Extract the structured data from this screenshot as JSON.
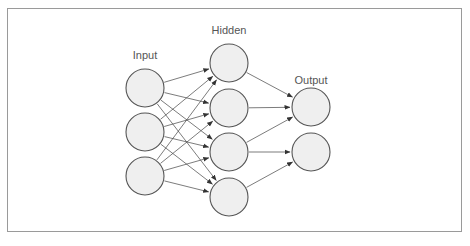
{
  "diagram": {
    "layers": [
      {
        "id": "input",
        "label": "Input",
        "label_pos": {
          "x": 145,
          "y": 59
        },
        "nodes": [
          {
            "id": "i1",
            "cx": 145,
            "cy": 88
          },
          {
            "id": "i2",
            "cx": 145,
            "cy": 132
          },
          {
            "id": "i3",
            "cx": 145,
            "cy": 176
          }
        ]
      },
      {
        "id": "hidden",
        "label": "Hidden",
        "label_pos": {
          "x": 229,
          "y": 34
        },
        "nodes": [
          {
            "id": "h1",
            "cx": 229,
            "cy": 63
          },
          {
            "id": "h2",
            "cx": 229,
            "cy": 108
          },
          {
            "id": "h3",
            "cx": 229,
            "cy": 152
          },
          {
            "id": "h4",
            "cx": 229,
            "cy": 197
          }
        ]
      },
      {
        "id": "output",
        "label": "Output",
        "label_pos": {
          "x": 311,
          "y": 84
        },
        "nodes": [
          {
            "id": "o1",
            "cx": 311,
            "cy": 107
          },
          {
            "id": "o2",
            "cx": 311,
            "cy": 152
          }
        ]
      }
    ],
    "node_radius": 19,
    "edges": [
      [
        "i1",
        "h1"
      ],
      [
        "i1",
        "h2"
      ],
      [
        "i1",
        "h3"
      ],
      [
        "i1",
        "h4"
      ],
      [
        "i2",
        "h1"
      ],
      [
        "i2",
        "h2"
      ],
      [
        "i2",
        "h3"
      ],
      [
        "i2",
        "h4"
      ],
      [
        "i3",
        "h1"
      ],
      [
        "i3",
        "h2"
      ],
      [
        "i3",
        "h3"
      ],
      [
        "i3",
        "h4"
      ],
      [
        "h1",
        "o1"
      ],
      [
        "h2",
        "o1"
      ],
      [
        "h3",
        "o1"
      ],
      [
        "h3",
        "o2"
      ],
      [
        "h4",
        "o2"
      ]
    ],
    "colors": {
      "node_fill": "#efefef",
      "node_stroke": "#555555",
      "edge": "#444444",
      "label": "#555555",
      "frame": "#9a9a9a"
    }
  }
}
